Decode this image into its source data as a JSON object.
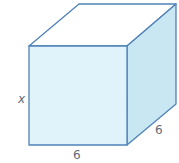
{
  "figure": {
    "shape": "cube",
    "labels": {
      "height": "x",
      "width": "6",
      "depth": "6"
    },
    "colors": {
      "front_face": "#e0f2fa",
      "right_face": "#c9e6f3",
      "top_face": "#ffffff",
      "edge": "#4f82b8",
      "label": "#5f6b78"
    }
  }
}
